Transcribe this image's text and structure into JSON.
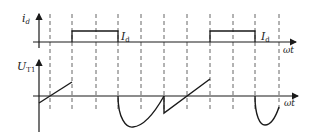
{
  "diagram": {
    "type": "waveform",
    "colors": {
      "stroke": "#1a1a1a",
      "dash": "#555555",
      "background": "#ffffff"
    },
    "top_plot": {
      "y_label": "i",
      "y_label_sub": "d",
      "x_label": "ωt",
      "pulse_label": "I",
      "pulse_label_sub": "d",
      "pulses": [
        {
          "start_x": 72,
          "end_x": 118,
          "label": "I_d"
        },
        {
          "start_x": 210,
          "end_x": 255,
          "label": "I_d"
        }
      ]
    },
    "bottom_plot": {
      "y_label": "U",
      "y_label_sub": "T1",
      "x_label": "ωt"
    },
    "dashed_lines_x": [
      50,
      72,
      96,
      118,
      141,
      164,
      187,
      210,
      233,
      255,
      279
    ]
  }
}
